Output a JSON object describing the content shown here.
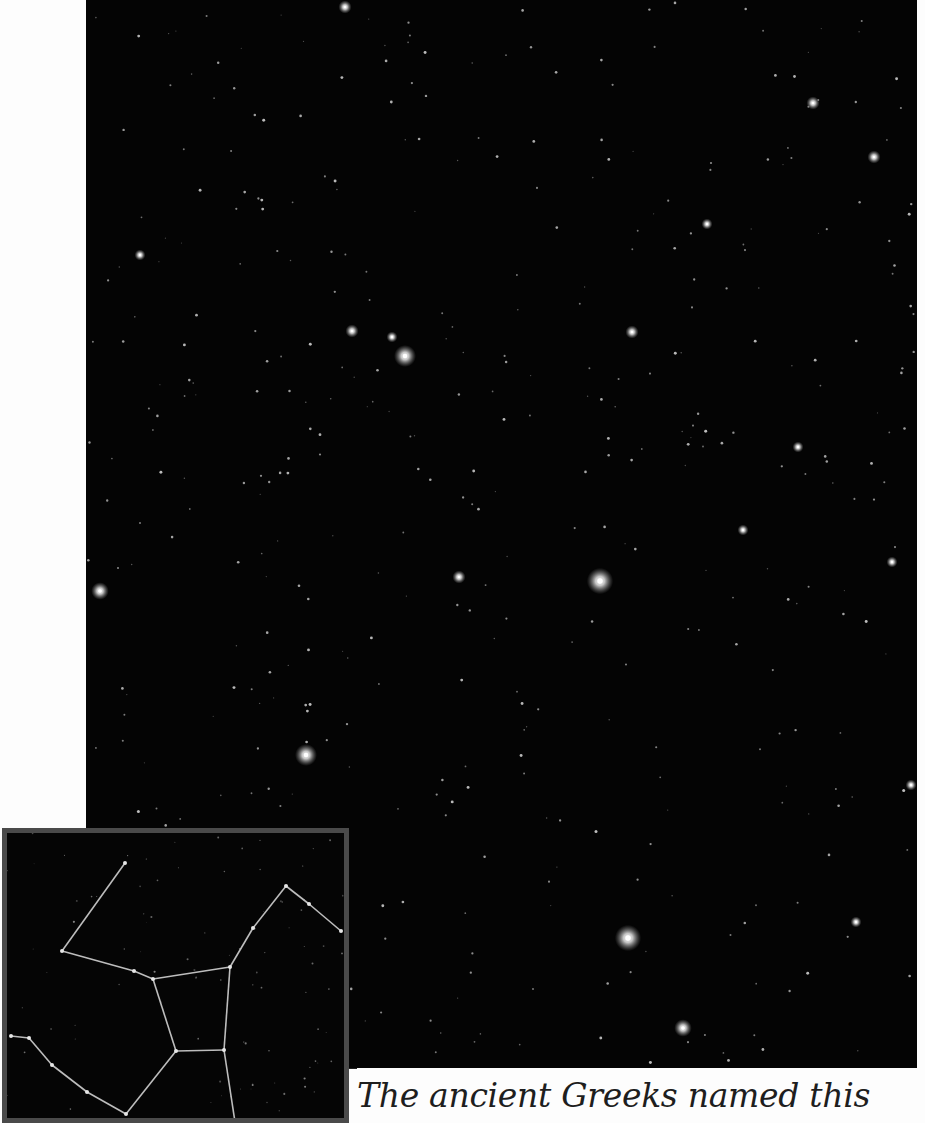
{
  "page": {
    "background_color": "#fdfdfd",
    "photo_background": "#040404",
    "inset_border_color": "#4a4a4a"
  },
  "star_photo": {
    "description": "Star field photograph of the constellation Hercules",
    "bright_stars": [
      {
        "x": 405,
        "y": 356,
        "r": 5
      },
      {
        "x": 600,
        "y": 581,
        "r": 6
      },
      {
        "x": 628,
        "y": 938,
        "r": 6
      },
      {
        "x": 306,
        "y": 755,
        "r": 5
      },
      {
        "x": 683,
        "y": 1028,
        "r": 4
      },
      {
        "x": 100,
        "y": 591,
        "r": 4
      },
      {
        "x": 352,
        "y": 331,
        "r": 3
      },
      {
        "x": 632,
        "y": 332,
        "r": 3
      },
      {
        "x": 813,
        "y": 103,
        "r": 3
      },
      {
        "x": 874,
        "y": 157,
        "r": 3
      },
      {
        "x": 459,
        "y": 577,
        "r": 3
      },
      {
        "x": 345,
        "y": 7,
        "r": 3
      },
      {
        "x": 707,
        "y": 224,
        "r": 2.5
      },
      {
        "x": 140,
        "y": 255,
        "r": 2.5
      },
      {
        "x": 392,
        "y": 337,
        "r": 2.5
      },
      {
        "x": 911,
        "y": 785,
        "r": 2.5
      },
      {
        "x": 856,
        "y": 922,
        "r": 2.5
      },
      {
        "x": 892,
        "y": 562,
        "r": 2.5
      },
      {
        "x": 743,
        "y": 530,
        "r": 2.5
      },
      {
        "x": 798,
        "y": 447,
        "r": 2.5
      }
    ],
    "faint_star_seed": 42,
    "faint_star_count": 420
  },
  "inset": {
    "description": "Hercules constellation stick-figure diagram",
    "line_color": "#bdbdbd",
    "nodes": {
      "A": [
        118,
        30
      ],
      "B": [
        55,
        118
      ],
      "C": [
        127,
        138
      ],
      "D": [
        146,
        146
      ],
      "E": [
        223,
        134
      ],
      "F": [
        246,
        95
      ],
      "G": [
        279,
        53
      ],
      "H": [
        302,
        71
      ],
      "I": [
        334,
        98
      ],
      "J": [
        169,
        218
      ],
      "K": [
        217,
        217
      ],
      "L": [
        228,
        289
      ],
      "M": [
        119,
        281
      ],
      "N": [
        80,
        259
      ],
      "O": [
        45,
        232
      ],
      "P": [
        22,
        205
      ],
      "Q": [
        4,
        203
      ]
    },
    "edges": [
      [
        "A",
        "B"
      ],
      [
        "B",
        "C"
      ],
      [
        "C",
        "D"
      ],
      [
        "D",
        "E"
      ],
      [
        "E",
        "F"
      ],
      [
        "F",
        "G"
      ],
      [
        "G",
        "H"
      ],
      [
        "H",
        "I"
      ],
      [
        "D",
        "J"
      ],
      [
        "E",
        "K"
      ],
      [
        "J",
        "K"
      ],
      [
        "K",
        "L"
      ],
      [
        "J",
        "M"
      ],
      [
        "M",
        "N"
      ],
      [
        "N",
        "O"
      ],
      [
        "O",
        "P"
      ],
      [
        "P",
        "Q"
      ]
    ]
  },
  "caption": {
    "text": "The ancient Greeks named this"
  }
}
